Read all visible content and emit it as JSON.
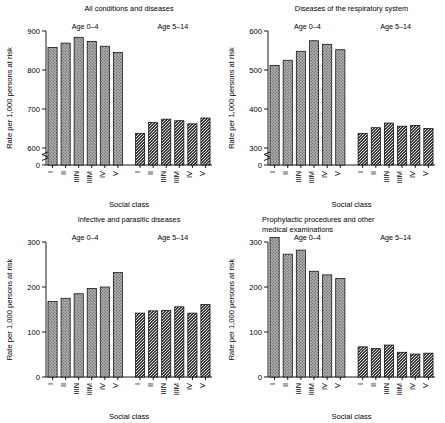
{
  "figure": {
    "axis_label_y": "Rate per 1,000 persons at risk",
    "axis_label_x": "Social class",
    "group_labels": [
      "Age 0–4",
      "Age 5–14"
    ],
    "social_classes": [
      "I",
      "II",
      "IIIN",
      "IIIM",
      "IV",
      "V"
    ]
  },
  "chart_data": [
    {
      "type": "bar",
      "title": "All conditions and diseases",
      "xlabel": "Social class",
      "ylabel": "Rate per 1,000 persons at risk",
      "categories": [
        "I",
        "II",
        "IIIN",
        "IIIM",
        "IV",
        "V"
      ],
      "series": [
        {
          "name": "Age 0–4",
          "values": [
            858,
            869,
            884,
            873,
            861,
            845
          ]
        },
        {
          "name": "Age 5–14",
          "values": [
            637,
            665,
            674,
            670,
            662,
            677
          ]
        }
      ],
      "yticks": [
        0,
        600,
        700,
        800,
        900
      ],
      "ylim": [
        0,
        900
      ],
      "axis_break": true,
      "grid": false,
      "legend": "none"
    },
    {
      "type": "bar",
      "title": "Diseases of the respiratory system",
      "xlabel": "Social class",
      "ylabel": "Rate per 1,000 persons at risk",
      "categories": [
        "I",
        "II",
        "IIIN",
        "IIIM",
        "IV",
        "V"
      ],
      "series": [
        {
          "name": "Age 0–4",
          "values": [
            512,
            525,
            548,
            575,
            566,
            552
          ]
        },
        {
          "name": "Age 5–14",
          "values": [
            337,
            352,
            364,
            356,
            358,
            350
          ]
        }
      ],
      "yticks": [
        0,
        300,
        400,
        500,
        600
      ],
      "ylim": [
        0,
        600
      ],
      "axis_break": true,
      "grid": false,
      "legend": "none"
    },
    {
      "type": "bar",
      "title": "Infective and parasitic diseases",
      "xlabel": "Social class",
      "ylabel": "Rate per 1,000 persons at risk",
      "categories": [
        "I",
        "II",
        "IIIN",
        "IIIM",
        "IV",
        "V"
      ],
      "series": [
        {
          "name": "Age 0–4",
          "values": [
            168,
            175,
            185,
            197,
            200,
            232
          ]
        },
        {
          "name": "Age 5–14",
          "values": [
            142,
            147,
            148,
            156,
            142,
            161
          ]
        }
      ],
      "yticks": [
        0,
        100,
        200,
        300
      ],
      "ylim": [
        0,
        300
      ],
      "axis_break": false,
      "grid": false,
      "legend": "none"
    },
    {
      "type": "bar",
      "title": "Prophylactic procedures and other medical examinations",
      "title_lines": [
        "Prophylactic procedures and other",
        "medical examinations"
      ],
      "xlabel": "Social class",
      "ylabel": "Rate per 1,000 persons at risk",
      "categories": [
        "I",
        "II",
        "IIIN",
        "IIIM",
        "IV",
        "V"
      ],
      "series": [
        {
          "name": "Age 0–4",
          "values": [
            310,
            273,
            282,
            235,
            227,
            219
          ]
        },
        {
          "name": "Age 5–14",
          "values": [
            67,
            63,
            71,
            55,
            51,
            53
          ]
        }
      ],
      "yticks": [
        0,
        100,
        200,
        300
      ],
      "ylim": [
        0,
        300
      ],
      "axis_break": false,
      "grid": false,
      "legend": "none"
    }
  ]
}
